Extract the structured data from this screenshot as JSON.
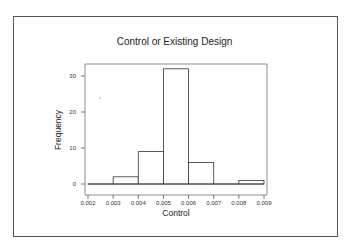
{
  "chart_data": {
    "type": "bar",
    "subtype": "histogram",
    "title": "Control or Existing Design",
    "xlabel": "Control",
    "ylabel": "Frequency",
    "bins": [
      {
        "start": 0.002,
        "end": 0.003,
        "count": 0
      },
      {
        "start": 0.003,
        "end": 0.004,
        "count": 2
      },
      {
        "start": 0.004,
        "end": 0.005,
        "count": 9
      },
      {
        "start": 0.005,
        "end": 0.006,
        "count": 32
      },
      {
        "start": 0.006,
        "end": 0.007,
        "count": 6
      },
      {
        "start": 0.007,
        "end": 0.008,
        "count": 0
      },
      {
        "start": 0.008,
        "end": 0.009,
        "count": 1
      }
    ],
    "categories": [
      "0.002-0.003",
      "0.003-0.004",
      "0.004-0.005",
      "0.005-0.006",
      "0.006-0.007",
      "0.007-0.008",
      "0.008-0.009"
    ],
    "values": [
      0,
      2,
      9,
      32,
      6,
      0,
      1
    ],
    "x_ticks": [
      "0.002",
      "0.003",
      "0.004",
      "0.005",
      "0.006",
      "0.007",
      "0.008",
      "0.009"
    ],
    "y_ticks": [
      "0",
      "10",
      "20",
      "30"
    ],
    "xlim": [
      0.002,
      0.009
    ],
    "ylim": [
      0,
      33
    ],
    "grid": false,
    "legend": null
  }
}
